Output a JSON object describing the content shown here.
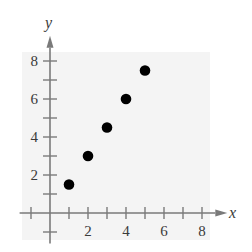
{
  "chart_data": {
    "type": "scatter",
    "title": "",
    "xlabel": "x",
    "ylabel": "y",
    "x": [
      1,
      2,
      3,
      4,
      5
    ],
    "y": [
      1.5,
      3,
      4.5,
      6,
      7.5
    ],
    "series": [
      {
        "name": "points",
        "x": [
          1,
          2,
          3,
          4,
          5
        ],
        "y": [
          1.5,
          3,
          4.5,
          6,
          7.5
        ]
      }
    ],
    "xlim": [
      -1,
      8.5
    ],
    "ylim": [
      -1,
      8.5
    ],
    "x_ticks": [
      -1,
      1,
      2,
      3,
      4,
      5,
      6,
      7,
      8
    ],
    "x_tick_labels": [
      "2",
      "4",
      "6",
      "8"
    ],
    "y_ticks": [
      -1,
      1,
      2,
      3,
      4,
      5,
      6,
      7,
      8
    ],
    "y_tick_labels": [
      "2",
      "4",
      "6",
      "8"
    ],
    "grid": false,
    "legend": "none",
    "colors": {
      "background_panel": "#f4f4f4",
      "axis": "#7a7a7a",
      "point": "#000000",
      "text": "#3a3a3a"
    }
  },
  "labels": {
    "x_axis": "x",
    "y_axis": "y",
    "x_ticks": [
      "2",
      "4",
      "6",
      "8"
    ],
    "y_ticks": [
      "2",
      "4",
      "6",
      "8"
    ]
  }
}
